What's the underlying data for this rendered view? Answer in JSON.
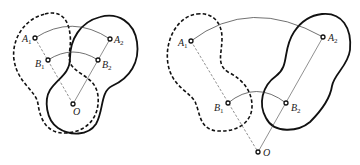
{
  "figures": [
    {
      "id": "left",
      "description": "Rotation of a planar body about point O; original position dashed, rotated position solid (small rotation angle)",
      "points": {
        "A1": {
          "label": "A",
          "sub": "1",
          "x": 35,
          "y": 38
        },
        "B1": {
          "label": "B",
          "sub": "1",
          "x": 48,
          "y": 60
        },
        "A2": {
          "label": "A",
          "sub": "2",
          "x": 110,
          "y": 39
        },
        "B2": {
          "label": "B",
          "sub": "2",
          "x": 98,
          "y": 60
        },
        "O": {
          "label": "O",
          "sub": "",
          "x": 73,
          "y": 104
        }
      }
    },
    {
      "id": "right",
      "description": "Rotation of a planar body about point O; original position dashed, rotated position solid (larger rotation angle)",
      "points": {
        "A1": {
          "label": "A",
          "sub": "1",
          "x": 191,
          "y": 41
        },
        "B1": {
          "label": "B",
          "sub": "1",
          "x": 228,
          "y": 103
        },
        "A2": {
          "label": "A",
          "sub": "2",
          "x": 323,
          "y": 37
        },
        "B2": {
          "label": "B",
          "sub": "2",
          "x": 286,
          "y": 103
        },
        "O": {
          "label": "O",
          "sub": "",
          "x": 258,
          "y": 152
        }
      }
    }
  ],
  "labels": {
    "left_A1": "A",
    "left_A1_sub": "1",
    "left_B1": "B",
    "left_B1_sub": "1",
    "left_A2": "A",
    "left_A2_sub": "2",
    "left_B2": "B",
    "left_B2_sub": "2",
    "left_O": "O",
    "right_A1": "A",
    "right_A1_sub": "1",
    "right_B1": "B",
    "right_B1_sub": "1",
    "right_A2": "A",
    "right_A2_sub": "2",
    "right_B2": "B",
    "right_B2_sub": "2",
    "right_O": "O"
  },
  "legend": {
    "dashed": "original position",
    "solid": "rotated position"
  }
}
